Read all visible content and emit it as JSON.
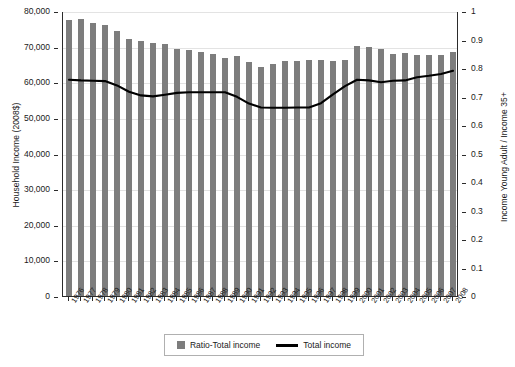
{
  "chart_data": {
    "type": "bar",
    "title": "",
    "subtitle": "",
    "xlabel": "",
    "ylabel": "Household Income (2008$)",
    "y2label": "Income Young Adult / Income 35+",
    "ylim": [
      0,
      80000
    ],
    "y2lim": [
      0,
      1
    ],
    "grid": true,
    "legend_position": "bottom-center",
    "categories": [
      "1976",
      "1977",
      "1978",
      "1979",
      "1980",
      "1981",
      "1982",
      "1983",
      "1984",
      "1985",
      "1986",
      "1987",
      "1988",
      "1989",
      "1990",
      "1991",
      "1992",
      "1993",
      "1994",
      "1995",
      "1996",
      "1997",
      "1998",
      "1999",
      "2000",
      "2001",
      "2002",
      "2003",
      "2004",
      "2005",
      "2006",
      "2007",
      "2008"
    ],
    "ytick_labels": [
      "0",
      "10,000",
      "20,000",
      "30,000",
      "40,000",
      "50,000",
      "60,000",
      "70,000",
      "80,000"
    ],
    "ytick_values": [
      0,
      10000,
      20000,
      30000,
      40000,
      50000,
      60000,
      70000,
      80000
    ],
    "y2tick_labels": [
      "0",
      "0.1",
      "0.2",
      "0.3",
      "0.4",
      "0.5",
      "0.6",
      "0.7",
      "0.8",
      "0.9",
      "1"
    ],
    "y2tick_values": [
      0,
      0.1,
      0.2,
      0.3,
      0.4,
      0.5,
      0.6,
      0.7,
      0.8,
      0.9,
      1
    ],
    "series": [
      {
        "name": "Ratio-Total income",
        "type": "bar",
        "axis": "right",
        "color": "#7d7d7d",
        "values": [
          0.968,
          0.972,
          0.958,
          0.952,
          0.93,
          0.903,
          0.896,
          0.889,
          0.884,
          0.866,
          0.862,
          0.855,
          0.848,
          0.836,
          0.842,
          0.82,
          0.804,
          0.814,
          0.824,
          0.826,
          0.828,
          0.828,
          0.826,
          0.83,
          0.879,
          0.875,
          0.866,
          0.85,
          0.853,
          0.845,
          0.846,
          0.845,
          0.858
        ]
      },
      {
        "name": "Total income",
        "type": "line",
        "axis": "left",
        "color": "#000000",
        "values": [
          61000,
          60800,
          60700,
          60600,
          59400,
          57600,
          56600,
          56300,
          56800,
          57300,
          57500,
          57500,
          57500,
          57500,
          56200,
          54300,
          53200,
          53100,
          53100,
          53200,
          53200,
          54400,
          56900,
          59200,
          61000,
          60800,
          60300,
          60700,
          60800,
          61700,
          62100,
          62600,
          63500
        ]
      }
    ],
    "legend": [
      {
        "label": "Ratio-Total income",
        "marker": "square",
        "color": "#7d7d7d"
      },
      {
        "label": "Total income",
        "marker": "line",
        "color": "#000000"
      }
    ]
  }
}
